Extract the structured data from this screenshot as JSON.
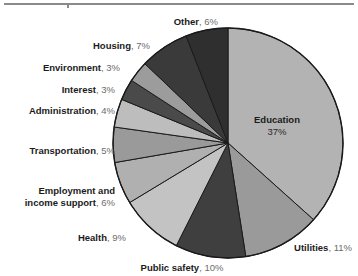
{
  "chart_data": {
    "type": "pie",
    "title": "",
    "subtitle": "",
    "xlabel": "",
    "ylabel": "",
    "legend_position": "callout-labels",
    "grid": false,
    "unit": "%",
    "start_angle_deg": 0,
    "direction": "clockwise",
    "categories": [
      "Education",
      "Utilities",
      "Public safety",
      "Health",
      "Employment and income support",
      "Transportation",
      "Administration",
      "Interest",
      "Environment",
      "Housing",
      "Other"
    ],
    "values": [
      37,
      11,
      10,
      9,
      6,
      5,
      4,
      3,
      3,
      7,
      6
    ],
    "slice_colors": [
      "#b3b3b3",
      "#9a9a9a",
      "#3f3f3f",
      "#c3c3c3",
      "#b0b0b0",
      "#9a9a9a",
      "#bdbdbd",
      "#4a4a4a",
      "#9c9c9c",
      "#3a3a3a",
      "#2f2f2f"
    ]
  },
  "chart": {
    "outline_color": "#1a1a1a",
    "background": "#ffffff",
    "center": {
      "x": 228,
      "y": 143
    },
    "radius": 115,
    "slices": [
      {
        "id": "education",
        "category": "Education",
        "percent_label": "37%",
        "value": 37,
        "color": "#b3b3b3",
        "label_mode": "inside",
        "label_x": 234,
        "label_y": 114,
        "label_width": 86
      },
      {
        "id": "utilities",
        "category": "Utilities",
        "percent_label": "11%",
        "value": 11,
        "color": "#9a9a9a",
        "label_mode": "outside",
        "label_x": 266,
        "label_y": 242,
        "label_width": 86,
        "label_align": "right"
      },
      {
        "id": "public-safety",
        "category": "Public safety",
        "percent_label": "10%",
        "value": 10,
        "color": "#3f3f3f",
        "label_mode": "outside",
        "label_x": 127,
        "label_y": 262,
        "label_width": 110,
        "label_align": "center"
      },
      {
        "id": "health",
        "category": "Health",
        "percent_label": "9%",
        "value": 9,
        "color": "#c3c3c3",
        "label_mode": "outside",
        "label_x": 26,
        "label_y": 232,
        "label_width": 100,
        "label_align": "right"
      },
      {
        "id": "employment",
        "category": "Employment and income support",
        "category_line1": "Employment and",
        "category_line2": "income support",
        "percent_label": "6%",
        "value": 6,
        "color": "#b0b0b0",
        "label_mode": "outside",
        "label_x": 2,
        "label_y": 185,
        "label_width": 113,
        "label_align": "right"
      },
      {
        "id": "transportation",
        "category": "Transportation",
        "percent_label": "5%",
        "value": 5,
        "color": "#9a9a9a",
        "label_mode": "outside",
        "label_x": 4,
        "label_y": 145,
        "label_width": 111,
        "label_align": "right"
      },
      {
        "id": "administration",
        "category": "Administration",
        "percent_label": "4%",
        "value": 4,
        "color": "#bdbdbd",
        "label_mode": "outside",
        "label_x": 8,
        "label_y": 105,
        "label_width": 107,
        "label_align": "right"
      },
      {
        "id": "interest",
        "category": "Interest",
        "percent_label": "3%",
        "value": 3,
        "color": "#4a4a4a",
        "label_mode": "outside",
        "label_x": 25,
        "label_y": 84,
        "label_width": 90,
        "label_align": "right"
      },
      {
        "id": "environment",
        "category": "Environment",
        "percent_label": "3%",
        "value": 3,
        "color": "#9c9c9c",
        "label_mode": "outside",
        "label_x": 15,
        "label_y": 62,
        "label_width": 105,
        "label_align": "right"
      },
      {
        "id": "housing",
        "category": "Housing",
        "percent_label": "7%",
        "value": 7,
        "color": "#3a3a3a",
        "label_mode": "outside",
        "label_x": 50,
        "label_y": 40,
        "label_width": 100,
        "label_align": "right"
      },
      {
        "id": "other",
        "category": "Other",
        "percent_label": "6%",
        "value": 6,
        "color": "#2f2f2f",
        "label_mode": "outside",
        "label_x": 118,
        "label_y": 16,
        "label_width": 100,
        "label_align": "right"
      }
    ]
  }
}
